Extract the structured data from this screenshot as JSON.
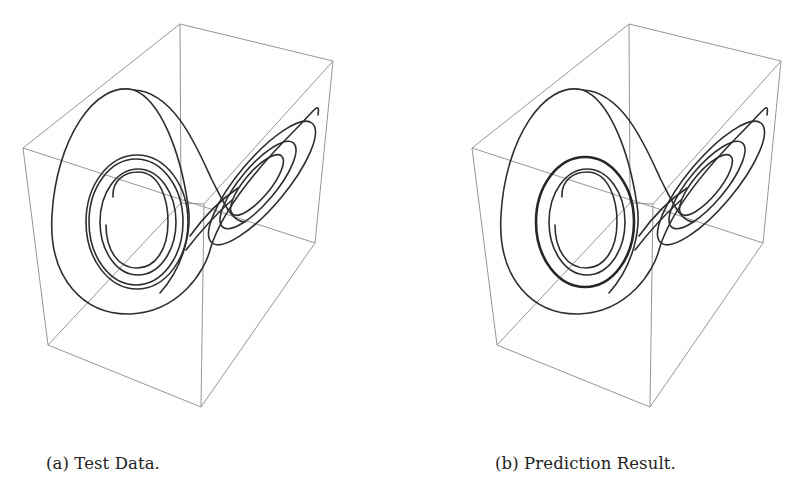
{
  "figure": {
    "panels": [
      {
        "id": "a",
        "caption": "(a) Test Data.",
        "offset_x": 0,
        "box": {
          "top_back": [
            180,
            24
          ],
          "top_right": [
            333,
            61
          ],
          "top_left": [
            23,
            148
          ],
          "top_front": [
            204,
            204
          ],
          "bottom_back": [
            181,
            203
          ],
          "bottom_right": [
            315,
            243
          ],
          "bottom_left": [
            48,
            345
          ],
          "bottom_front": [
            201,
            407
          ]
        },
        "merged_inner_loop": false
      },
      {
        "id": "b",
        "caption": "(b) Prediction Result.",
        "offset_x": 449,
        "box": {
          "top_back": [
            629,
            24
          ],
          "top_right": [
            781,
            61
          ],
          "top_left": [
            472,
            148
          ],
          "top_front": [
            653,
            204
          ],
          "bottom_back": [
            630,
            203
          ],
          "bottom_right": [
            763,
            243
          ],
          "bottom_left": [
            497,
            345
          ],
          "bottom_front": [
            650,
            407
          ]
        },
        "merged_inner_loop": true
      }
    ],
    "colors": {
      "background": "#ffffff",
      "box_edges": "#8a8a8a",
      "trajectory": "#2e2e2e",
      "caption_text": "#222222"
    }
  }
}
